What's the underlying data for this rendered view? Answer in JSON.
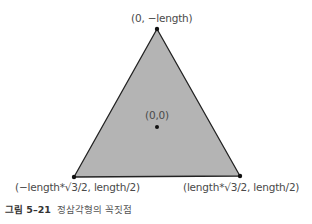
{
  "diagram": {
    "shape": "equilateral-triangle",
    "fill_color": "#b4b4b4",
    "stroke_color": "#222222",
    "vertices": [
      {
        "name": "top",
        "label": "(0, −length)"
      },
      {
        "name": "bottom-left",
        "label": "(−length*√3/2, length/2)"
      },
      {
        "name": "bottom-right",
        "label": "(length*√3/2, length/2)"
      }
    ],
    "center": {
      "label": "(0,0)"
    }
  },
  "caption": {
    "number": "그림 5–21",
    "text": "정삼각형의 꼭짓점"
  }
}
